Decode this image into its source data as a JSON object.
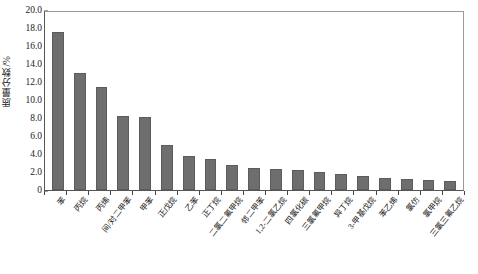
{
  "chart_data": {
    "type": "bar",
    "title": "",
    "xlabel": "",
    "ylabel": "质量分数/%",
    "ylim": [
      0,
      20
    ],
    "ytick_labels": [
      "0",
      "2.0",
      "4.0",
      "6.0",
      "8.0",
      "10.0",
      "12.0",
      "14.0",
      "16.0",
      "18.0",
      "20.0"
    ],
    "ytick_values": [
      0,
      2,
      4,
      6,
      8,
      10,
      12,
      14,
      16,
      18,
      20
    ],
    "grid": false,
    "legend": "none",
    "bar_color": "#6e6e6e",
    "categories": [
      "苯",
      "丙烷",
      "丙烯",
      "间/对二甲苯",
      "甲苯",
      "正戊烷",
      "乙苯",
      "正丁烷",
      "二氯二氟甲烷",
      "邻二甲苯",
      "1,2-二氯乙烷",
      "四氯化碳",
      "三氯氟甲烷",
      "异丁烷",
      "3-甲基戊烷",
      "苯乙烯",
      "氯仿",
      "氯甲烷",
      "三氯三氟乙烷"
    ],
    "values": [
      17.6,
      13.0,
      11.5,
      8.25,
      8.1,
      5.0,
      3.8,
      3.5,
      2.75,
      2.45,
      2.3,
      2.2,
      2.0,
      1.8,
      1.55,
      1.35,
      1.2,
      1.1,
      1.05
    ],
    "series": [
      {
        "name": "质量分数",
        "values": [
          17.6,
          13.0,
          11.5,
          8.25,
          8.1,
          5.0,
          3.8,
          3.5,
          2.75,
          2.45,
          2.3,
          2.2,
          2.0,
          1.8,
          1.55,
          1.35,
          1.2,
          1.1,
          1.05
        ]
      }
    ]
  }
}
